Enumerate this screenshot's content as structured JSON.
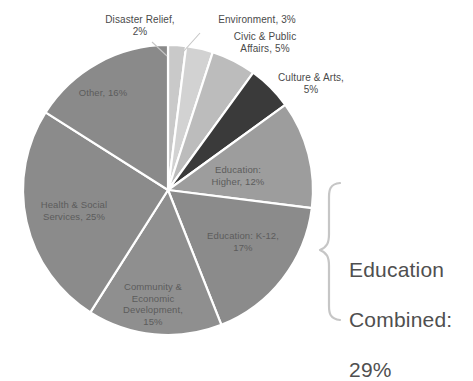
{
  "chart_data": {
    "type": "pie",
    "title": "",
    "categories": [
      "Disaster Relief",
      "Environment",
      "Civic & Public Affairs",
      "Culture & Arts",
      "Education: Higher",
      "Education: K-12",
      "Community & Economic Development",
      "Health & Social Services",
      "Other"
    ],
    "values": [
      2,
      3,
      5,
      5,
      12,
      17,
      15,
      25,
      16
    ],
    "value_unit": "%",
    "slice_colors": [
      "#c9c9c9",
      "#d2d2d2",
      "#bcbcbc",
      "#3a3a3a",
      "#9d9d9d",
      "#8b8b8b",
      "#8f8f8f",
      "#8b8b8b",
      "#8a8a8a"
    ],
    "start_angle_deg": 0,
    "direction": "clockwise",
    "legend": "none",
    "grid": false,
    "annotations": [
      {
        "name": "education-combined-callout",
        "text": "Education Combined: 29%",
        "value": 29,
        "covers": [
          "Education: Higher",
          "Education: K-12"
        ]
      }
    ]
  },
  "labels": {
    "disaster_relief": "Disaster Relief,\n2%",
    "environment": "Environment, 3%",
    "civic_public_affairs": "Civic & Public\nAffairs, 5%",
    "culture_arts": "Culture & Arts,\n5%",
    "other": "Other, 16%",
    "health_social": "Health & Social\nServices, 25%",
    "community_economic": "Community &\nEconomic\nDevelopment,\n15%",
    "education_k12": "Education: K-12,\n17%",
    "education_higher": "Education:\nHigher, 12%"
  },
  "callout": {
    "line1": "Education",
    "line2": "Combined:",
    "line3": "29%"
  },
  "colors": {
    "background": "#ffffff",
    "label_text": "#4a4a4a",
    "slice_label_text": "#5c5c5c",
    "callout_text": "#4f4f4f",
    "slice_divider": "#ffffff",
    "brace_stroke": "#c6c6c6"
  }
}
